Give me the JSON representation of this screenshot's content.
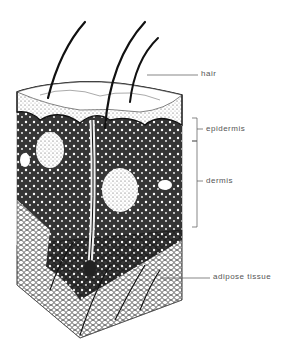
{
  "diagram": {
    "type": "anatomical cross-section illustration",
    "labels": [
      {
        "id": "hair",
        "text": "hair"
      },
      {
        "id": "epidermis",
        "text": "epidermis"
      },
      {
        "id": "dermis",
        "text": "dermis"
      },
      {
        "id": "adipose",
        "text": "adipose tissue"
      }
    ]
  }
}
